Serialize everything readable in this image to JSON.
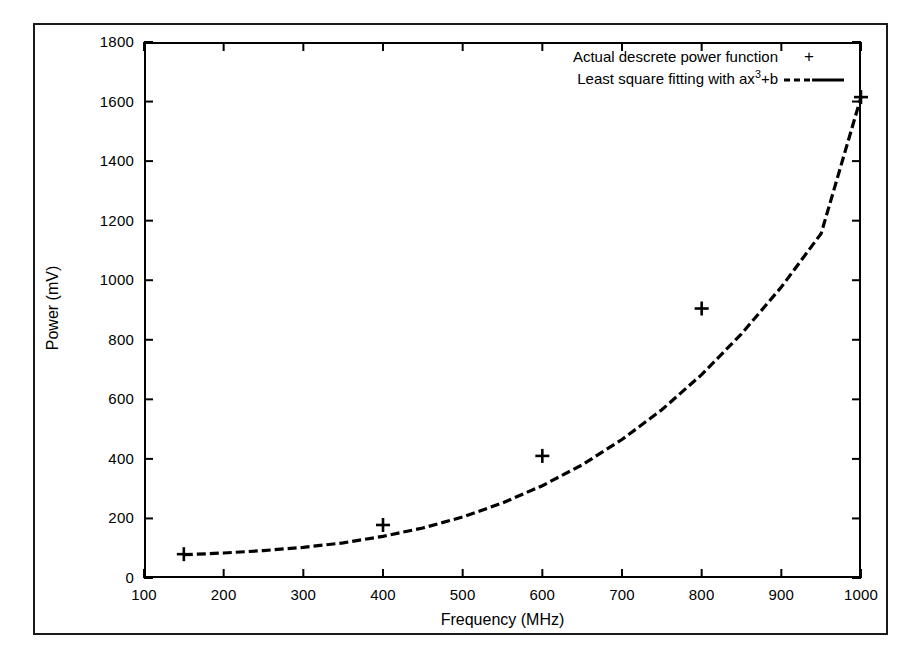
{
  "chart_data": {
    "type": "line",
    "title": "",
    "xlabel": "Frequency (MHz)",
    "ylabel": "Power (mV)",
    "xlim": [
      100,
      1000
    ],
    "ylim": [
      0,
      1800
    ],
    "xticks": [
      100,
      200,
      300,
      400,
      500,
      600,
      700,
      800,
      900,
      1000
    ],
    "yticks": [
      0,
      200,
      400,
      600,
      800,
      1000,
      1200,
      1400,
      1600,
      1800
    ],
    "grid": false,
    "legend_position": "top-right inside",
    "series": [
      {
        "name": "Actual descrete power function",
        "marker": "+",
        "style": "points",
        "x": [
          150,
          400,
          600,
          800,
          1000
        ],
        "y": [
          80,
          178,
          410,
          905,
          1615
        ]
      },
      {
        "name": "Least square fitting with ax3+b",
        "marker": "none",
        "style": "dashed-line",
        "x": [
          150,
          200,
          250,
          300,
          350,
          400,
          450,
          500,
          550,
          600,
          650,
          700,
          750,
          800,
          850,
          900,
          950,
          1000
        ],
        "y": [
          78,
          84,
          92,
          103,
          118,
          140,
          168,
          205,
          252,
          310,
          380,
          465,
          565,
          683,
          820,
          977,
          1157,
          1615
        ]
      }
    ]
  },
  "axes": {
    "x_tick_labels": [
      "100",
      "200",
      "300",
      "400",
      "500",
      "600",
      "700",
      "800",
      "900",
      "1000"
    ],
    "y_tick_labels": [
      "0",
      "200",
      "400",
      "600",
      "800",
      "1000",
      "1200",
      "1400",
      "1600",
      "1800"
    ],
    "x_title": "Frequency (MHz)",
    "y_title": "Power (mV)"
  },
  "legend": {
    "entries": [
      {
        "label_main": "Actual descrete power function",
        "key": "plus-marker",
        "key_glyph": "+"
      },
      {
        "label_prefix": "Least square fitting with ax",
        "label_sup": "3",
        "label_suffix": "+b",
        "key": "dashed-line-sample"
      }
    ]
  },
  "colors": {
    "ink": "#000000",
    "page": "#ffffff",
    "frame": "#1a1a1a"
  }
}
